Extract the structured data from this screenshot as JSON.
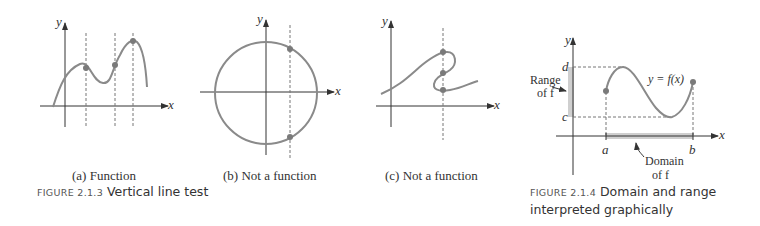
{
  "panels": [
    {
      "id": "a",
      "caption": "(a) Function"
    },
    {
      "id": "b",
      "caption": "(b) Not a function"
    },
    {
      "id": "c",
      "caption": "(c) Not a function"
    }
  ],
  "axis_labels": {
    "x": "x",
    "y": "y"
  },
  "figure_213": {
    "label": "FIGURE 2.1.3",
    "text": "Vertical line test"
  },
  "figure_214": {
    "label": "FIGURE 2.1.4",
    "line1": "Domain and range",
    "line2": "interpreted graphically",
    "curve_label": "y = f(x)",
    "tick_a": "a",
    "tick_b": "b",
    "tick_c": "c",
    "tick_d": "d",
    "range_label_1": "Range",
    "range_label_2": "of f",
    "domain_label_1": "Domain",
    "domain_label_2": "of f"
  },
  "colors": {
    "curve": "#8a8a8a",
    "axis": "#333333",
    "dot": "#7a7a7a",
    "shade": "#cfcfcf"
  }
}
